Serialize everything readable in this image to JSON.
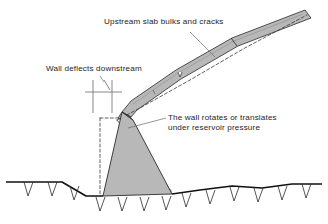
{
  "figure": {
    "type": "engineering-cross-section",
    "background_color": "#ffffff",
    "line_color": "#1d1d1d",
    "fill_gray": "#b8b8b8",
    "fill_gray_light": "#c9c9c9",
    "dash_color": "#3a3a3a"
  },
  "labels": {
    "upstream_slab": "Upstream slab bulks and cracks",
    "wall_deflects": "Wall deflects downstream",
    "wall_rotates_line1": "The wall rotates or translates",
    "wall_rotates_line2": "under reservoir pressure"
  },
  "elements": {
    "upstream_slab_name": "upstream-slab",
    "dam_body_name": "dam-body-triangle",
    "ground_name": "foundation-ground-line",
    "original_position_name": "original-position-dashed-outline",
    "deflection_marker_name": "deflection-dimension-marker",
    "crack_name": "slab-crack-mark",
    "joint_name": "slab-joint-line"
  }
}
